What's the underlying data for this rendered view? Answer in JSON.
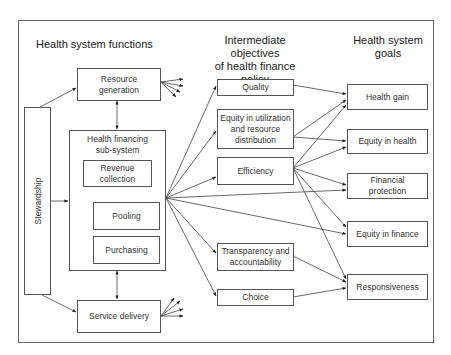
{
  "headings": {
    "functions": "Health system functions",
    "objectives_line1": "Intermediate objectives",
    "objectives_line2": "of health finance policy",
    "goals_line1": "Health system",
    "goals_line2": "goals"
  },
  "functions": {
    "stewardship": "Stewardship",
    "resource_generation_line1": "Resource",
    "resource_generation_line2": "generation",
    "health_financing_line1": "Health financing",
    "health_financing_line2": "sub-system",
    "revenue_collection_line1": "Revenue",
    "revenue_collection_line2": "collection",
    "pooling": "Pooling",
    "purchasing": "Purchasing",
    "service_delivery": "Service delivery"
  },
  "objectives": {
    "quality": "Quality",
    "equity_utilization_line1": "Equity in utilization",
    "equity_utilization_line2": "and resource",
    "equity_utilization_line3": "distribution",
    "efficiency": "Efficiency",
    "transparency_line1": "Transparency and",
    "transparency_line2": "accountability",
    "choice": "Choice"
  },
  "goals": {
    "health_gain": "Health gain",
    "equity_in_health": "Equity in health",
    "financial_protection_line1": "Financial",
    "financial_protection_line2": "protection",
    "equity_in_finance": "Equity in finance",
    "responsiveness": "Responsiveness"
  },
  "connections": [
    {
      "from": "stewardship",
      "to": "resource-generation"
    },
    {
      "from": "stewardship",
      "to": "health-financing-subsystem"
    },
    {
      "from": "stewardship",
      "to": "service-delivery"
    },
    {
      "from": "resource-generation",
      "to": "health-financing-subsystem",
      "bidirectional": true
    },
    {
      "from": "health-financing-subsystem",
      "to": "service-delivery",
      "bidirectional": true
    },
    {
      "from": "revenue-collection",
      "to": "pooling",
      "bidirectional": true
    },
    {
      "from": "pooling",
      "to": "purchasing",
      "bidirectional": true
    },
    {
      "from": "health-financing-subsystem",
      "to": "quality"
    },
    {
      "from": "health-financing-subsystem",
      "to": "equity-utilization"
    },
    {
      "from": "health-financing-subsystem",
      "to": "efficiency"
    },
    {
      "from": "health-financing-subsystem",
      "to": "financial-protection"
    },
    {
      "from": "health-financing-subsystem",
      "to": "equity-in-finance"
    },
    {
      "from": "health-financing-subsystem",
      "to": "transparency"
    },
    {
      "from": "health-financing-subsystem",
      "to": "choice"
    },
    {
      "from": "quality",
      "to": "health-gain"
    },
    {
      "from": "equity-utilization",
      "to": "health-gain"
    },
    {
      "from": "equity-utilization",
      "to": "equity-in-health"
    },
    {
      "from": "efficiency",
      "to": "health-gain"
    },
    {
      "from": "efficiency",
      "to": "equity-in-health"
    },
    {
      "from": "efficiency",
      "to": "financial-protection"
    },
    {
      "from": "efficiency",
      "to": "equity-in-finance"
    },
    {
      "from": "efficiency",
      "to": "responsiveness"
    },
    {
      "from": "transparency",
      "to": "responsiveness"
    },
    {
      "from": "choice",
      "to": "responsiveness"
    }
  ]
}
